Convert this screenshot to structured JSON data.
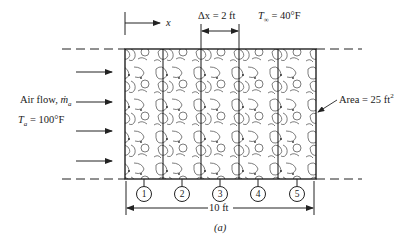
{
  "figure": {
    "caption": "(a)",
    "x_axis_label": "x",
    "delta_x_label": "Δx = 2 ft",
    "t_inf_symbol": "T",
    "t_inf_sub": "∞",
    "t_inf_value": " = 40°F",
    "air_flow_label": "Air flow, ",
    "air_flow_symbol": "ṁ",
    "air_flow_sub": "a",
    "t_a_symbol": "T",
    "t_a_sub": "a",
    "t_a_value": " = 100°F",
    "area_label": "Area = 25 ft",
    "area_sup": "2",
    "length_label": "10 ft",
    "nodes": [
      "1",
      "2",
      "3",
      "4",
      "5"
    ],
    "segment_count": 5
  }
}
